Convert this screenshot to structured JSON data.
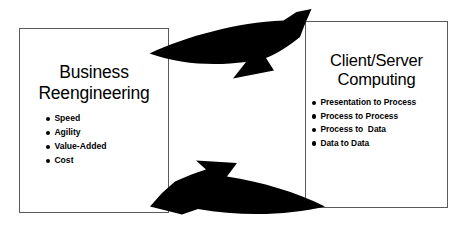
{
  "diagram": {
    "background_color": "#ffffff",
    "arrow_color": "#000000",
    "border_color": "#5a5a5a"
  },
  "left_panel": {
    "title_line1": "Business",
    "title_line2": "Reengineering",
    "bullets": [
      "Speed",
      "Agility",
      "Value-Added",
      "Cost"
    ]
  },
  "right_panel": {
    "title_line1": "Client/Server",
    "title_line2": "Computing",
    "bullets": [
      "Presentation to Process",
      "Process to Process",
      "Process to  Data",
      "Data to Data"
    ]
  },
  "arrows": [
    {
      "name": "top-arrow",
      "direction": "left-to-right"
    },
    {
      "name": "bottom-arrow",
      "direction": "right-to-left"
    }
  ]
}
